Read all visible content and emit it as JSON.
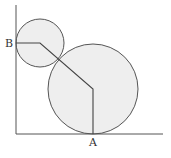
{
  "diagram": {
    "labels": {
      "A": "A",
      "B": "B"
    },
    "colors": {
      "stroke": "#555555",
      "fill": "#eeeeee",
      "background": "#ffffff"
    },
    "axes": {
      "y_axis": {
        "x": 16,
        "y1": 5,
        "y2": 134
      },
      "x_axis": {
        "y": 134,
        "x1": 16,
        "x2": 163
      }
    },
    "circles": [
      {
        "name": "small-circle",
        "cx": 40,
        "cy": 43,
        "r": 24
      },
      {
        "name": "large-circle",
        "cx": 93,
        "cy": 89,
        "r": 45
      }
    ],
    "path": {
      "points": [
        [
          16,
          43
        ],
        [
          40,
          43
        ],
        [
          93,
          89
        ],
        [
          93,
          134
        ]
      ],
      "start_label": "B",
      "end_label": "A"
    }
  }
}
